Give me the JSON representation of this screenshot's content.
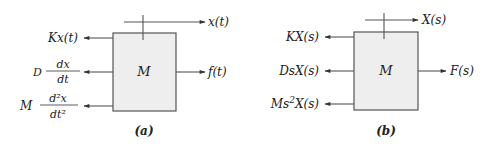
{
  "diagrams": [
    {
      "id": "a",
      "caption": "(a)",
      "mass_label": "M",
      "displacement_label": "x(t)",
      "applied_force_label": "f(t)",
      "opposing_forces": [
        {
          "name": "spring",
          "coef": "K",
          "expr": "x(t)"
        },
        {
          "name": "damper",
          "coef": "D",
          "num": "dx",
          "den": "dt"
        },
        {
          "name": "inertia",
          "coef": "M",
          "num": "d²x",
          "den": "dt²"
        }
      ]
    },
    {
      "id": "b",
      "caption": "(b)",
      "mass_label": "M",
      "displacement_label": "X(s)",
      "applied_force_label": "F(s)",
      "opposing_forces": [
        {
          "name": "spring",
          "label": "KX(s)"
        },
        {
          "name": "damper",
          "label": "DsX(s)"
        },
        {
          "name": "inertia",
          "label_pre": "Ms",
          "label_sup": "2",
          "label_post": "X(s)"
        }
      ]
    }
  ],
  "colors": {
    "box_fill": "#eeeeee",
    "line": "#555555",
    "text": "#222222"
  }
}
